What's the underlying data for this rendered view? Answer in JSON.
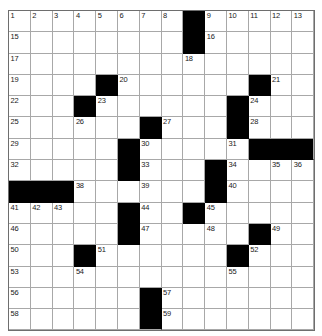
{
  "puzzle": {
    "type": "crossword-grid",
    "rows": 15,
    "columns": 14,
    "cell_colors": {
      "open": "#ffffff",
      "block": "#000000",
      "gridline": "#a8a8a8",
      "border": "#6e6e6e",
      "number_text": "#1a1a1a"
    },
    "block_cells": [
      [
        0,
        8
      ],
      [
        1,
        8
      ],
      [
        3,
        4
      ],
      [
        3,
        11
      ],
      [
        4,
        3
      ],
      [
        4,
        10
      ],
      [
        5,
        6
      ],
      [
        5,
        10
      ],
      [
        6,
        5
      ],
      [
        6,
        11
      ],
      [
        6,
        12
      ],
      [
        6,
        13
      ],
      [
        7,
        5
      ],
      [
        7,
        9
      ],
      [
        8,
        0
      ],
      [
        8,
        1
      ],
      [
        8,
        2
      ],
      [
        8,
        9
      ],
      [
        9,
        5
      ],
      [
        9,
        8
      ],
      [
        10,
        5
      ],
      [
        10,
        11
      ],
      [
        11,
        3
      ],
      [
        11,
        10
      ],
      [
        13,
        6
      ],
      [
        14,
        6
      ]
    ],
    "numbered_cells": [
      {
        "row": 0,
        "col": 0,
        "number": "1"
      },
      {
        "row": 0,
        "col": 1,
        "number": "2"
      },
      {
        "row": 0,
        "col": 2,
        "number": "3"
      },
      {
        "row": 0,
        "col": 3,
        "number": "4"
      },
      {
        "row": 0,
        "col": 4,
        "number": "5"
      },
      {
        "row": 0,
        "col": 5,
        "number": "6"
      },
      {
        "row": 0,
        "col": 6,
        "number": "7"
      },
      {
        "row": 0,
        "col": 7,
        "number": "8"
      },
      {
        "row": 0,
        "col": 9,
        "number": "9"
      },
      {
        "row": 0,
        "col": 10,
        "number": "10"
      },
      {
        "row": 0,
        "col": 11,
        "number": "11"
      },
      {
        "row": 0,
        "col": 12,
        "number": "12"
      },
      {
        "row": 0,
        "col": 13,
        "number": "13"
      },
      {
        "row": 0,
        "col": 14,
        "number": "14"
      },
      {
        "row": 1,
        "col": 0,
        "number": "15"
      },
      {
        "row": 1,
        "col": 9,
        "number": "16"
      },
      {
        "row": 2,
        "col": 0,
        "number": "17"
      },
      {
        "row": 2,
        "col": 8,
        "number": "18"
      },
      {
        "row": 3,
        "col": 0,
        "number": "19"
      },
      {
        "row": 3,
        "col": 5,
        "number": "20"
      },
      {
        "row": 3,
        "col": 12,
        "number": "21"
      },
      {
        "row": 4,
        "col": 0,
        "number": "22"
      },
      {
        "row": 4,
        "col": 4,
        "number": "23"
      },
      {
        "row": 4,
        "col": 11,
        "number": "24"
      },
      {
        "row": 5,
        "col": 0,
        "number": "25"
      },
      {
        "row": 5,
        "col": 3,
        "number": "26"
      },
      {
        "row": 5,
        "col": 7,
        "number": "27"
      },
      {
        "row": 5,
        "col": 11,
        "number": "28"
      },
      {
        "row": 6,
        "col": 0,
        "number": "29"
      },
      {
        "row": 6,
        "col": 6,
        "number": "30"
      },
      {
        "row": 6,
        "col": 10,
        "number": "31"
      },
      {
        "row": 7,
        "col": 0,
        "number": "32"
      },
      {
        "row": 7,
        "col": 6,
        "number": "33"
      },
      {
        "row": 7,
        "col": 10,
        "number": "34"
      },
      {
        "row": 7,
        "col": 12,
        "number": "35"
      },
      {
        "row": 7,
        "col": 13,
        "number": "36"
      },
      {
        "row": 7,
        "col": 14,
        "number": "37"
      },
      {
        "row": 8,
        "col": 3,
        "number": "38"
      },
      {
        "row": 8,
        "col": 6,
        "number": "39"
      },
      {
        "row": 8,
        "col": 10,
        "number": "40"
      },
      {
        "row": 9,
        "col": 0,
        "number": "41"
      },
      {
        "row": 9,
        "col": 1,
        "number": "42"
      },
      {
        "row": 9,
        "col": 2,
        "number": "43"
      },
      {
        "row": 9,
        "col": 6,
        "number": "44"
      },
      {
        "row": 9,
        "col": 9,
        "number": "45"
      },
      {
        "row": 10,
        "col": 0,
        "number": "46"
      },
      {
        "row": 10,
        "col": 6,
        "number": "47"
      },
      {
        "row": 10,
        "col": 9,
        "number": "48"
      },
      {
        "row": 10,
        "col": 12,
        "number": "49"
      },
      {
        "row": 11,
        "col": 0,
        "number": "50"
      },
      {
        "row": 11,
        "col": 4,
        "number": "51"
      },
      {
        "row": 11,
        "col": 11,
        "number": "52"
      },
      {
        "row": 12,
        "col": 0,
        "number": "53"
      },
      {
        "row": 12,
        "col": 3,
        "number": "54"
      },
      {
        "row": 12,
        "col": 10,
        "number": "55"
      },
      {
        "row": 13,
        "col": 0,
        "number": "56"
      },
      {
        "row": 13,
        "col": 7,
        "number": "57"
      },
      {
        "row": 14,
        "col": 0,
        "number": "58"
      },
      {
        "row": 14,
        "col": 7,
        "number": "59"
      }
    ]
  }
}
